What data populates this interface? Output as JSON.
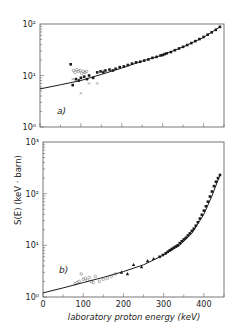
{
  "figure": {
    "ylabel": "S(E) (keV · barn)",
    "xlabel": "laboratory proton energy (keV)",
    "colors": {
      "ink": "#1a1a1a",
      "frame": "#555555",
      "background": "#ffffff",
      "open_marker": "#777777"
    }
  },
  "panels": [
    {
      "label": "a)",
      "y_ticks": [
        "10⁰",
        "10¹",
        "10²"
      ],
      "x_ticks": [
        "0",
        "100",
        "200",
        "300",
        "400"
      ]
    },
    {
      "label": "b)",
      "y_ticks": [
        "10⁰",
        "10¹",
        "10²",
        "10³"
      ],
      "x_ticks": [
        "0",
        "100",
        "200",
        "300",
        "400"
      ]
    }
  ],
  "chart_data": [
    {
      "type": "scatter",
      "title": "a)",
      "xlabel": "laboratory proton energy (keV)",
      "ylabel": "S(E) (keV · barn)",
      "xlim": [
        0,
        450
      ],
      "ylim": [
        1,
        100
      ],
      "yscale": "log",
      "grid": false,
      "legend": null,
      "series": [
        {
          "name": "filled squares",
          "marker": "square-filled",
          "x": [
            75,
            80,
            88,
            95,
            100,
            108,
            115,
            120,
            130,
            140,
            148,
            155,
            160,
            170,
            178,
            185,
            195,
            205,
            215,
            225,
            235,
            245,
            255,
            265,
            275,
            285,
            295,
            300,
            305,
            310,
            320,
            330,
            340,
            350,
            360,
            370,
            380,
            390,
            400,
            410,
            420,
            430,
            440
          ],
          "y": [
            16.5,
            6.5,
            8.5,
            8.0,
            9.0,
            9.5,
            8.5,
            10.0,
            9.0,
            11.5,
            12.0,
            11.5,
            12.5,
            13.0,
            12.5,
            13.5,
            14.5,
            15.0,
            16.0,
            17.0,
            18.0,
            18.5,
            19.5,
            20.5,
            22.0,
            23.0,
            24.5,
            25.0,
            26.0,
            27.0,
            28.5,
            31.0,
            33.5,
            36.0,
            39.0,
            42.5,
            46.5,
            51.0,
            56.0,
            62.0,
            69.0,
            77.0,
            88.0
          ]
        },
        {
          "name": "open symbols",
          "marker": "circle-open",
          "x": [
            82,
            86,
            90,
            94,
            98,
            102,
            106,
            110,
            114
          ],
          "y": [
            12.5,
            11.5,
            13.0,
            12.0,
            12.5,
            11.0,
            12.0,
            11.5,
            12.0
          ]
        },
        {
          "name": "crosses",
          "marker": "x",
          "x": [
            80,
            100,
            120,
            140,
            155
          ],
          "y": [
            8.5,
            4.5,
            7.0,
            7.0,
            12.5
          ]
        },
        {
          "name": "fit curve",
          "marker": "line",
          "x": [
            0,
            50,
            100,
            150,
            200,
            250,
            300,
            350,
            400,
            440
          ],
          "y": [
            5.5,
            6.6,
            8.0,
            10.5,
            14.0,
            19.0,
            25.0,
            36.0,
            55.0,
            88.0
          ]
        }
      ]
    },
    {
      "type": "scatter",
      "title": "b)",
      "xlabel": "laboratory proton energy (keV)",
      "ylabel": "S(E) (keV · barn)",
      "xlim": [
        0,
        450
      ],
      "ylim": [
        1,
        1000
      ],
      "yscale": "log",
      "grid": false,
      "legend": null,
      "series": [
        {
          "name": "filled squares",
          "marker": "square-filled",
          "x": [
            290,
            298,
            305,
            310,
            315,
            320,
            325,
            330,
            335,
            340,
            345,
            350,
            355,
            360,
            365,
            370,
            375,
            380,
            385,
            390,
            395,
            400,
            405,
            410,
            415,
            420,
            425,
            430,
            435,
            440
          ],
          "y": [
            6.0,
            6.5,
            7.0,
            7.5,
            8.0,
            8.5,
            9.0,
            9.5,
            10.0,
            11.0,
            12.0,
            13.0,
            14.0,
            15.5,
            17.0,
            19.0,
            21.0,
            24.0,
            28.0,
            33.0,
            39.0,
            47.0,
            57.0,
            70.0,
            88.0,
            110.0,
            140.0,
            170.0,
            200.0,
            230.0
          ]
        },
        {
          "name": "filled triangles",
          "marker": "triangle-filled",
          "x": [
            195,
            210,
            225,
            245,
            260,
            275
          ],
          "y": [
            3.0,
            2.8,
            4.2,
            3.8,
            5.0,
            5.5
          ]
        },
        {
          "name": "open symbols",
          "marker": "circle-open",
          "x": [
            80,
            85,
            90,
            95,
            100,
            105,
            110,
            115,
            120,
            125,
            130,
            140,
            150,
            160,
            170,
            180
          ],
          "y": [
            1.8,
            1.9,
            2.0,
            2.8,
            2.2,
            2.3,
            2.1,
            2.4,
            2.0,
            1.9,
            2.5,
            2.0,
            2.2,
            2.3,
            2.5,
            2.8
          ]
        },
        {
          "name": "fit curve",
          "marker": "line",
          "x": [
            0,
            50,
            100,
            150,
            200,
            250,
            300,
            340,
            370,
            400,
            420,
            440
          ],
          "y": [
            1.2,
            1.5,
            1.9,
            2.4,
            3.1,
            4.2,
            6.5,
            10.0,
            17.0,
            40.0,
            90.0,
            230.0
          ]
        }
      ]
    }
  ]
}
